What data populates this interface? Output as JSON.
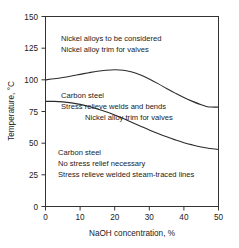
{
  "chart_data": {
    "type": "line",
    "title": "",
    "xlabel": "NaOH concentration, %",
    "ylabel": "Temperature, °C",
    "xlim": [
      0,
      50
    ],
    "ylim": [
      0,
      150
    ],
    "xticks": [
      0,
      10,
      20,
      30,
      40,
      50
    ],
    "xticklabels": [
      "0",
      "10",
      "20",
      "30",
      "40",
      "50"
    ],
    "yticks": [
      0,
      25,
      50,
      75,
      100,
      125,
      150
    ],
    "yticklabels": [
      "0",
      "25",
      "50",
      "75",
      "100",
      "125",
      "150"
    ],
    "grid": false,
    "legend": "none",
    "series": [
      {
        "name": "Upper boundary (nickel alloy required above)",
        "x": [
          0,
          2.5,
          5,
          7.5,
          10,
          12.5,
          15,
          17.5,
          20,
          22.5,
          25,
          27.5,
          30,
          32.5,
          35,
          37.5,
          40,
          42.5,
          45,
          46.5,
          48,
          50
        ],
        "values": [
          100,
          100.8,
          101.8,
          103,
          104.3,
          105.6,
          106.8,
          107.6,
          108,
          107.6,
          106.2,
          103.8,
          100.6,
          97,
          93.2,
          89.5,
          86,
          83,
          80.3,
          79,
          78.5,
          78.5
        ]
      },
      {
        "name": "Lower boundary (stress relief required above)",
        "x": [
          0,
          2.5,
          5,
          7.5,
          10,
          12.5,
          15,
          17.5,
          20,
          22.5,
          25,
          27.5,
          30,
          32.5,
          35,
          37.5,
          40,
          42.5,
          45,
          47.5,
          50
        ],
        "values": [
          83,
          83,
          82.6,
          81.8,
          80.6,
          79,
          77,
          74.8,
          72.2,
          69.4,
          66.4,
          63.4,
          60.4,
          57.6,
          55,
          52.6,
          50.4,
          48.6,
          47,
          45.8,
          45
        ]
      }
    ],
    "annotations": [
      {
        "name": "top-region-note",
        "lines": [
          "Nickel alloys to be considered",
          "Nickel alloy trim for valves"
        ],
        "x_data": 4.5,
        "y_data": 139
      },
      {
        "name": "middle-region-note",
        "lines": [
          "Carbon steel",
          "Stress relieve welds and bends"
        ],
        "x_data": 4.5,
        "y_data": 94
      },
      {
        "name": "middle-region-note-indent",
        "lines": [
          "Nickel alloy trim for valves"
        ],
        "x_data": 11.5,
        "y_data": 79
      },
      {
        "name": "bottom-region-note",
        "lines": [
          "Carbon steel",
          "No stress relief necessary",
          "Stress relieve welded steam-traced lines"
        ],
        "x_data": 3.5,
        "y_data": 41
      }
    ]
  },
  "colors": {
    "background": "#ffffff",
    "axis": "#333333",
    "curve": "#2b2b2b",
    "text": "#1a1a1a"
  }
}
